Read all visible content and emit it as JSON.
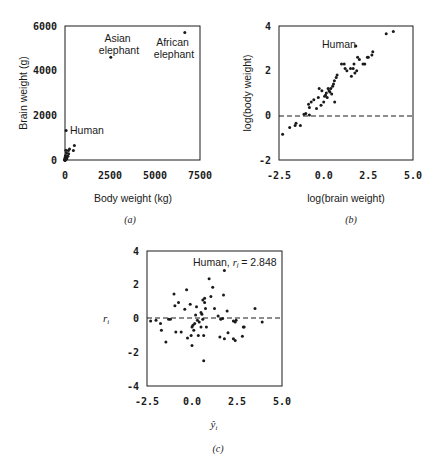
{
  "chart_data": [
    {
      "id": "a",
      "type": "scatter",
      "caption": "(a)",
      "xlabel": "Body weight (kg)",
      "ylabel": "Brain weight (g)",
      "xlim": [
        0,
        7500
      ],
      "ylim": [
        0,
        6000
      ],
      "xticks": [
        "0",
        "2500",
        "5000",
        "7500"
      ],
      "yticks": [
        "0",
        "2000",
        "4000",
        "6000"
      ],
      "grid": false,
      "annotations": [
        {
          "text": "Asian\nelephant",
          "x": 2547,
          "y": 4603
        },
        {
          "text": "African\nelephant",
          "x": 6654,
          "y": 5712
        },
        {
          "text": "Human",
          "x": 62,
          "y": 1320
        }
      ],
      "points": [
        [
          6654,
          5712
        ],
        [
          2547,
          4603
        ],
        [
          62,
          1320
        ],
        [
          521,
          655
        ],
        [
          465,
          423
        ],
        [
          250,
          490
        ],
        [
          187,
          419
        ],
        [
          160,
          169
        ],
        [
          100,
          157
        ],
        [
          85,
          325
        ],
        [
          60,
          81
        ],
        [
          55,
          180
        ],
        [
          52,
          440
        ],
        [
          36,
          119
        ],
        [
          35,
          56
        ],
        [
          27,
          115
        ],
        [
          14,
          98
        ],
        [
          10,
          115
        ],
        [
          10,
          60
        ],
        [
          6,
          12
        ],
        [
          4,
          26
        ],
        [
          3,
          25
        ],
        [
          3,
          44
        ],
        [
          2,
          12
        ],
        [
          1,
          6
        ],
        [
          1,
          5
        ],
        [
          1,
          3
        ],
        [
          0.5,
          3
        ],
        [
          0.3,
          2
        ],
        [
          0.1,
          1
        ],
        [
          100,
          60
        ],
        [
          200,
          280
        ],
        [
          40,
          200
        ],
        [
          20,
          160
        ],
        [
          15,
          50
        ],
        [
          8,
          40
        ],
        [
          5,
          30
        ]
      ]
    },
    {
      "id": "b",
      "type": "scatter",
      "caption": "(b)",
      "xlabel": "log(brain weight)",
      "ylabel": "log(body weight)",
      "xlim": [
        -2.5,
        5.0
      ],
      "ylim": [
        -2,
        4
      ],
      "xticks": [
        "-2.5",
        "0.0",
        "2.5",
        "5.0"
      ],
      "yticks": [
        "-2",
        "0",
        "2",
        "4"
      ],
      "reference_line": {
        "y": 0,
        "style": "dashed"
      },
      "annotations": [
        {
          "text": "Human",
          "x": 1.8,
          "y": 3.1
        }
      ],
      "points": [
        [
          -2.3,
          -0.85
        ],
        [
          -1.9,
          -0.55
        ],
        [
          -1.6,
          -0.45
        ],
        [
          -1.55,
          -0.35
        ],
        [
          -1.3,
          -0.45
        ],
        [
          -1.1,
          0.05
        ],
        [
          -1.0,
          0.08
        ],
        [
          -0.8,
          0.02
        ],
        [
          -0.85,
          0.5
        ],
        [
          -0.8,
          0.35
        ],
        [
          -0.7,
          0.6
        ],
        [
          -0.55,
          0.7
        ],
        [
          -0.4,
          0.3
        ],
        [
          -0.3,
          0.8
        ],
        [
          -0.25,
          1.2
        ],
        [
          -0.15,
          0.45
        ],
        [
          -0.1,
          1.1
        ],
        [
          0.0,
          0.6
        ],
        [
          0.05,
          0.85
        ],
        [
          0.1,
          0.9
        ],
        [
          0.15,
          1.0
        ],
        [
          0.2,
          0.8
        ],
        [
          0.25,
          1.2
        ],
        [
          0.3,
          1.1
        ],
        [
          0.35,
          1.05
        ],
        [
          0.4,
          1.2
        ],
        [
          0.45,
          0.95
        ],
        [
          0.5,
          1.3
        ],
        [
          0.55,
          1.4
        ],
        [
          0.6,
          1.55
        ],
        [
          0.62,
          0.6
        ],
        [
          0.7,
          1.7
        ],
        [
          0.75,
          1.8
        ],
        [
          1.0,
          2.3
        ],
        [
          1.15,
          2.3
        ],
        [
          1.2,
          2.1
        ],
        [
          1.3,
          2.0
        ],
        [
          1.5,
          2.1
        ],
        [
          1.55,
          1.75
        ],
        [
          1.65,
          2.1
        ],
        [
          1.7,
          2.3
        ],
        [
          1.75,
          1.9
        ],
        [
          1.8,
          3.1
        ],
        [
          1.85,
          2.0
        ],
        [
          1.9,
          2.6
        ],
        [
          2.0,
          2.5
        ],
        [
          2.2,
          2.3
        ],
        [
          2.3,
          2.3
        ],
        [
          2.45,
          2.6
        ],
        [
          2.5,
          2.6
        ],
        [
          2.7,
          2.7
        ],
        [
          2.75,
          2.85
        ],
        [
          3.5,
          3.65
        ],
        [
          3.9,
          3.75
        ]
      ]
    },
    {
      "id": "c",
      "type": "scatter",
      "caption": "(c)",
      "xlabel": "ŷ_i",
      "ylabel": "r_i",
      "xlim": [
        -2.5,
        5.0
      ],
      "ylim": [
        -4,
        4
      ],
      "xticks": [
        "-2.5",
        "0.0",
        "2.5",
        "5.0"
      ],
      "yticks": [
        "-4",
        "-2",
        "0",
        "2",
        "4"
      ],
      "reference_line": {
        "y": 0,
        "style": "dashed"
      },
      "annotations": [
        {
          "text": "Human, r_i = 2.848",
          "x": 1.8,
          "y": 2.848
        }
      ],
      "points": [
        [
          -2.3,
          -0.15
        ],
        [
          -2.0,
          -0.1
        ],
        [
          -1.75,
          -0.3
        ],
        [
          -1.7,
          -0.7
        ],
        [
          -1.45,
          -1.4
        ],
        [
          -1.3,
          -0.05
        ],
        [
          -1.2,
          -0.05
        ],
        [
          -1.0,
          1.45
        ],
        [
          -0.95,
          0.75
        ],
        [
          -0.9,
          -0.8
        ],
        [
          -0.75,
          0.95
        ],
        [
          -0.6,
          -0.8
        ],
        [
          -0.4,
          0.55
        ],
        [
          -0.3,
          1.7
        ],
        [
          -0.25,
          -1.15
        ],
        [
          -0.1,
          0.85
        ],
        [
          -0.05,
          -1.0
        ],
        [
          0.0,
          -1.6
        ],
        [
          0.0,
          -0.5
        ],
        [
          0.05,
          -0.4
        ],
        [
          0.1,
          -0.7
        ],
        [
          0.15,
          -0.3
        ],
        [
          0.2,
          0.2
        ],
        [
          0.25,
          0.7
        ],
        [
          0.3,
          -0.1
        ],
        [
          0.35,
          -1.0
        ],
        [
          0.4,
          -0.2
        ],
        [
          0.5,
          -0.5
        ],
        [
          0.5,
          0.35
        ],
        [
          0.55,
          0.25
        ],
        [
          0.6,
          -0.05
        ],
        [
          0.6,
          1.1
        ],
        [
          0.65,
          -1.0
        ],
        [
          0.65,
          -2.5
        ],
        [
          0.7,
          1.2
        ],
        [
          0.7,
          0.95
        ],
        [
          0.75,
          0.6
        ],
        [
          0.8,
          -0.5
        ],
        [
          0.95,
          2.35
        ],
        [
          1.05,
          1.3
        ],
        [
          1.15,
          1.85
        ],
        [
          1.25,
          0.6
        ],
        [
          1.45,
          0.15
        ],
        [
          1.55,
          -1.1
        ],
        [
          1.6,
          -0.05
        ],
        [
          1.7,
          0.0
        ],
        [
          1.75,
          1.4
        ],
        [
          1.8,
          2.848
        ],
        [
          1.8,
          -1.2
        ],
        [
          1.95,
          0.45
        ],
        [
          2.0,
          -0.85
        ],
        [
          2.3,
          -0.15
        ],
        [
          2.3,
          -1.2
        ],
        [
          2.4,
          -1.3
        ],
        [
          2.4,
          -0.2
        ],
        [
          2.45,
          -0.1
        ],
        [
          2.8,
          -1.05
        ],
        [
          2.85,
          -0.5
        ],
        [
          2.9,
          -0.5
        ],
        [
          3.5,
          0.6
        ],
        [
          3.9,
          -0.2
        ]
      ]
    }
  ]
}
